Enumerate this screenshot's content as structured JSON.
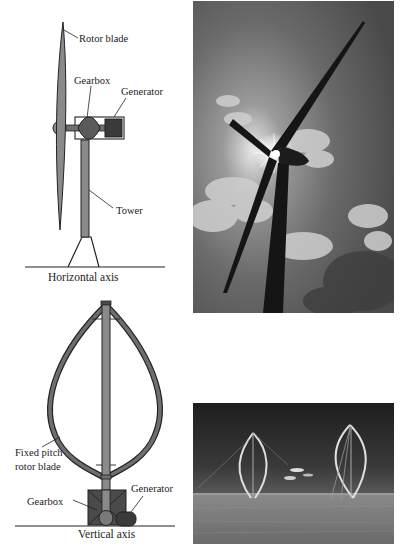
{
  "horizontal_turbine": {
    "caption": "Horizontal axis",
    "labels": {
      "rotor_blade": "Rotor blade",
      "gearbox": "Gearbox",
      "generator": "Generator",
      "tower": "Tower"
    }
  },
  "vertical_turbine": {
    "caption": "Vertical axis",
    "labels": {
      "blade_line1": "Fixed pitch",
      "blade_line2": "rotor blade",
      "gearbox": "Gearbox",
      "generator": "Generator"
    }
  },
  "photos": [
    {
      "subject": "horizontal-axis wind turbine silhouetted against cloudy sky with sun behind hub"
    },
    {
      "subject": "two vertical-axis Darrieus wind turbines on grassland"
    }
  ],
  "colors": {
    "blade_fill": "#8a8a8a",
    "dark_fill": "#4a4a4a",
    "generator_fill": "#3a3a3a",
    "line": "#222222"
  }
}
